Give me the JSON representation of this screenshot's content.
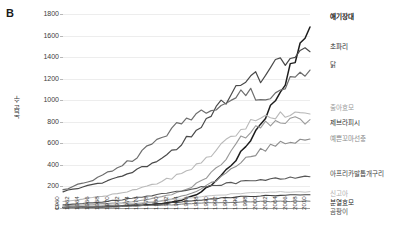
{
  "panel": {
    "label": "B"
  },
  "chart_data": {
    "type": "line",
    "title": "",
    "xlabel": "",
    "ylabel": "논문 수",
    "xlim": [
      1960,
      2010
    ],
    "ylim": [
      0,
      1800
    ],
    "ytick_step": 200,
    "grid": true,
    "legend_position": "right-inline-labels",
    "yticks": [
      0,
      200,
      400,
      600,
      800,
      1000,
      1200,
      1400,
      1600,
      1800
    ],
    "x": [
      1960,
      1962,
      1964,
      1966,
      1968,
      1970,
      1972,
      1974,
      1976,
      1978,
      1980,
      1982,
      1984,
      1986,
      1988,
      1990,
      1992,
      1994,
      1996,
      1998,
      2000,
      2002,
      2004,
      2006,
      2008,
      2010
    ],
    "xticklabels": [
      "1960",
      "1962",
      "1964",
      "1966",
      "1968",
      "1970",
      "1972",
      "1974",
      "1976",
      "1978",
      "1980",
      "1982",
      "1984",
      "1986",
      "1988",
      "1990",
      "1992",
      "1994",
      "1996",
      "1998",
      "2000",
      "2002",
      "2004",
      "2006",
      "2008",
      "2010"
    ],
    "series": [
      {
        "name": "애기장대",
        "color": "#1d1d1d",
        "width": 1.5,
        "label_color": "#141414",
        "label_weight": "bold",
        "values": [
          5,
          8,
          10,
          12,
          14,
          16,
          20,
          24,
          28,
          34,
          42,
          55,
          75,
          105,
          150,
          215,
          300,
          400,
          505,
          640,
          790,
          930,
          1090,
          1290,
          1480,
          1680
        ]
      },
      {
        "name": "초파리",
        "color": "#4a4a4a",
        "width": 1.2,
        "label_color": "#2b2b2b",
        "label_weight": "normal",
        "values": [
          150,
          175,
          195,
          215,
          240,
          270,
          300,
          330,
          370,
          420,
          470,
          530,
          600,
          690,
          780,
          880,
          960,
          1060,
          1140,
          1230,
          1210,
          1290,
          1350,
          1400,
          1420,
          1450
        ]
      },
      {
        "name": "닭",
        "color": "#6e6e6e",
        "width": 1.2,
        "label_color": "#3a3a3a",
        "label_weight": "normal",
        "values": [
          170,
          200,
          230,
          260,
          300,
          350,
          400,
          450,
          520,
          590,
          660,
          720,
          790,
          850,
          900,
          940,
          960,
          1000,
          1050,
          1090,
          980,
          1020,
          1110,
          1180,
          1230,
          1280
        ]
      },
      {
        "name": "출아효모",
        "color": "#b9b9b9",
        "width": 1.1,
        "label_color": "#9a9a9a",
        "label_weight": "normal",
        "values": [
          60,
          70,
          82,
          95,
          110,
          125,
          145,
          165,
          190,
          215,
          245,
          280,
          320,
          370,
          430,
          500,
          580,
          660,
          730,
          790,
          830,
          855,
          865,
          870,
          868,
          872
        ]
      },
      {
        "name": "제브라피시",
        "color": "#9a9a9a",
        "width": 1.1,
        "label_color": "#2f2f2f",
        "label_weight": "normal",
        "values": [
          20,
          24,
          28,
          32,
          38,
          44,
          52,
          60,
          72,
          86,
          104,
          126,
          155,
          195,
          250,
          320,
          410,
          520,
          640,
          720,
          760,
          790,
          800,
          810,
          815,
          820
        ]
      },
      {
        "name": "예쁜꼬마선충",
        "color": "#8e8e8e",
        "width": 1.1,
        "label_color": "#8a8a8a",
        "label_weight": "normal",
        "values": [
          8,
          10,
          12,
          15,
          18,
          22,
          27,
          33,
          41,
          52,
          66,
          84,
          108,
          140,
          180,
          230,
          290,
          355,
          420,
          480,
          530,
          570,
          600,
          620,
          632,
          640
        ]
      },
      {
        "name": "아프리카발톱개구리",
        "color": "#585858",
        "width": 1.1,
        "label_color": "#3d3d3d",
        "label_weight": "normal",
        "values": [
          30,
          36,
          42,
          50,
          58,
          68,
          78,
          90,
          102,
          116,
          130,
          146,
          162,
          178,
          192,
          205,
          218,
          230,
          240,
          250,
          258,
          266,
          272,
          280,
          285,
          290
        ]
      },
      {
        "name": "신고아",
        "color": "#c4c4c4",
        "width": 1.0,
        "label_color": "#b0b0b0",
        "label_weight": "normal",
        "values": [
          15,
          18,
          21,
          25,
          29,
          34,
          39,
          45,
          52,
          60,
          68,
          77,
          86,
          95,
          104,
          112,
          120,
          127,
          133,
          138,
          142,
          146,
          148,
          150,
          151,
          152
        ]
      },
      {
        "name": "분열효모",
        "color": "#3f3f3f",
        "width": 1.1,
        "label_color": "#1f1f1f",
        "label_weight": "normal",
        "values": [
          5,
          6,
          8,
          10,
          12,
          15,
          18,
          22,
          27,
          33,
          40,
          48,
          57,
          66,
          75,
          84,
          92,
          99,
          105,
          110,
          114,
          117,
          119,
          121,
          122,
          123
        ]
      },
      {
        "name": "곰팡이",
        "color": "#7a7a7a",
        "width": 1.0,
        "label_color": "#4a4a4a",
        "label_weight": "normal",
        "values": [
          4,
          5,
          6,
          7,
          9,
          11,
          13,
          16,
          19,
          23,
          27,
          31,
          36,
          40,
          44,
          48,
          51,
          54,
          56,
          58,
          59,
          60,
          61,
          62,
          62,
          63
        ]
      }
    ],
    "label_positions": [
      {
        "name": "애기장대",
        "top": 13,
        "left": 330
      },
      {
        "name": "초파리",
        "top": 43,
        "left": 330
      },
      {
        "name": "닭",
        "top": 61,
        "left": 330
      },
      {
        "name": "출아효모",
        "top": 104,
        "left": 330
      },
      {
        "name": "제브라피시",
        "top": 119,
        "left": 330
      },
      {
        "name": "예쁜꼬마선충",
        "top": 135,
        "left": 330
      },
      {
        "name": "아프리카발톱개구리",
        "top": 170,
        "left": 330
      },
      {
        "name": "신고아",
        "top": 190,
        "left": 330
      },
      {
        "name": "분열효모",
        "top": 199,
        "left": 330
      },
      {
        "name": "곰팡이",
        "top": 208,
        "left": 330
      }
    ]
  }
}
